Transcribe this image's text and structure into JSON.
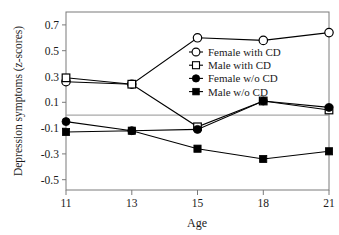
{
  "chart_data": {
    "type": "line",
    "title": "",
    "xlabel": "Age",
    "ylabel": "Depression symptoms (z-scores)",
    "categories": [
      "11",
      "13",
      "15",
      "18",
      "21"
    ],
    "x": [
      11,
      13,
      15,
      18,
      21
    ],
    "ylim": [
      -0.58,
      0.8
    ],
    "yticks": [
      "0.7",
      "0.5",
      "0.3",
      "0.1",
      "-0.1",
      "-0.3",
      "-0.5"
    ],
    "ytick_values": [
      0.7,
      0.5,
      0.3,
      0.1,
      -0.1,
      -0.3,
      -0.5
    ],
    "xticks": [
      "11",
      "13",
      "15",
      "18",
      "21"
    ],
    "grid": false,
    "zero_reference_line": 0.0,
    "legend_position": "upper-center-right",
    "series": [
      {
        "name": "Female with CD",
        "marker": "open-circle",
        "values": [
          0.26,
          0.24,
          0.6,
          0.58,
          0.64
        ]
      },
      {
        "name": "Male with CD",
        "marker": "open-square",
        "values": [
          0.29,
          0.24,
          -0.09,
          0.11,
          0.04
        ]
      },
      {
        "name": "Female w/o CD",
        "marker": "filled-circle",
        "values": [
          -0.05,
          -0.12,
          -0.11,
          0.11,
          0.06
        ]
      },
      {
        "name": "Male w/o CD",
        "marker": "filled-square",
        "values": [
          -0.13,
          -0.12,
          -0.26,
          -0.34,
          -0.28
        ]
      }
    ]
  },
  "legend": {
    "items": [
      {
        "label": "Female with CD",
        "marker": "open-circle"
      },
      {
        "label": "Male with CD",
        "marker": "open-square"
      },
      {
        "label": "Female w/o CD",
        "marker": "filled-circle"
      },
      {
        "label": "Male w/o CD",
        "marker": "filled-square"
      }
    ]
  },
  "colors": {
    "series": "#000000",
    "axis": "#7a7a7a",
    "zero_line": "#a8a8a8",
    "text": "#1a1a1a",
    "background": "#ffffff"
  }
}
